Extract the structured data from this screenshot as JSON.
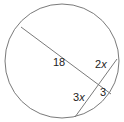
{
  "diagram": {
    "type": "circle-intersecting-chords",
    "stroke_color": "#7a7a7a",
    "labels": {
      "segment_long": "18",
      "segment_upper_right_coef": "2",
      "segment_lower_left_coef": "3",
      "segment_short": "3",
      "variable": "x"
    }
  }
}
